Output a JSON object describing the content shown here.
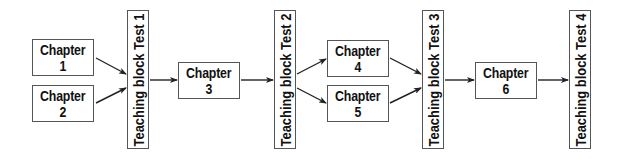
{
  "diagram": {
    "title": "",
    "chapters": [
      {
        "id": "c1",
        "line1": "Chapter",
        "line2": "1",
        "x": 32,
        "y": 39,
        "w": 62,
        "h": 37
      },
      {
        "id": "c2",
        "line1": "Chapter",
        "line2": "2",
        "x": 32,
        "y": 85,
        "w": 62,
        "h": 37
      },
      {
        "id": "c3",
        "line1": "Chapter",
        "line2": "3",
        "x": 178,
        "y": 62,
        "w": 62,
        "h": 37
      },
      {
        "id": "c4",
        "line1": "Chapter",
        "line2": "4",
        "x": 327,
        "y": 40,
        "w": 62,
        "h": 37
      },
      {
        "id": "c5",
        "line1": "Chapter",
        "line2": "5",
        "x": 327,
        "y": 85,
        "w": 62,
        "h": 37
      },
      {
        "id": "c6",
        "line1": "Chapter",
        "line2": "6",
        "x": 475,
        "y": 62,
        "w": 62,
        "h": 37
      }
    ],
    "tests": [
      {
        "id": "t1",
        "label": "Teaching block Test 1",
        "x": 127,
        "y": 10,
        "w": 22,
        "h": 139
      },
      {
        "id": "t2",
        "label": "Teaching block Test 2",
        "x": 274,
        "y": 10,
        "w": 22,
        "h": 139
      },
      {
        "id": "t3",
        "label": "Teaching block Test 3",
        "x": 422,
        "y": 10,
        "w": 22,
        "h": 139
      },
      {
        "id": "t4",
        "label": "Teaching block Test 4",
        "x": 569,
        "y": 10,
        "w": 22,
        "h": 139
      }
    ],
    "arrows": [
      {
        "from": "c1",
        "to": "t1",
        "x1": 96,
        "y1": 58,
        "x2": 126,
        "y2": 74
      },
      {
        "from": "c2",
        "to": "t1",
        "x1": 96,
        "y1": 103,
        "x2": 126,
        "y2": 88
      },
      {
        "from": "t1",
        "to": "c3",
        "x1": 150,
        "y1": 80,
        "x2": 177,
        "y2": 80
      },
      {
        "from": "c3",
        "to": "t2",
        "x1": 241,
        "y1": 80,
        "x2": 273,
        "y2": 80
      },
      {
        "from": "t2",
        "to": "c4",
        "x1": 297,
        "y1": 74,
        "x2": 326,
        "y2": 59
      },
      {
        "from": "t2",
        "to": "c5",
        "x1": 297,
        "y1": 88,
        "x2": 326,
        "y2": 103
      },
      {
        "from": "c4",
        "to": "t3",
        "x1": 390,
        "y1": 58,
        "x2": 421,
        "y2": 74
      },
      {
        "from": "c5",
        "to": "t3",
        "x1": 390,
        "y1": 103,
        "x2": 421,
        "y2": 88
      },
      {
        "from": "t3",
        "to": "c6",
        "x1": 445,
        "y1": 80,
        "x2": 474,
        "y2": 80
      },
      {
        "from": "c6",
        "to": "t4",
        "x1": 538,
        "y1": 80,
        "x2": 568,
        "y2": 80
      }
    ],
    "colors": {
      "border": "#555555",
      "text": "#111111",
      "arrow": "#222222",
      "background": "#ffffff"
    }
  }
}
